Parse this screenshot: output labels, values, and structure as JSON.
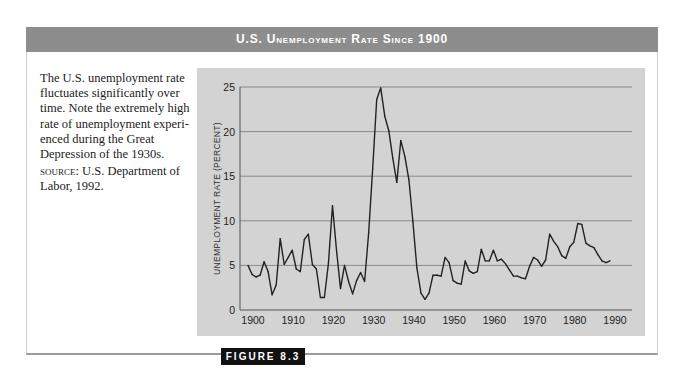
{
  "header": {
    "title": "U.S. Unemployment Rate Since 1900"
  },
  "caption": {
    "text": "The U.S. unemployment rate fluctuates significantly over time. Note the extremely high rate of unemployment experi­enced during the Great Depression of the 1930s.",
    "source_label": "source:",
    "source_text": " U.S. Department of Labor, 1992."
  },
  "figure_label": "FIGURE 8.3",
  "chart_data": {
    "type": "line",
    "title": "U.S. Unemployment Rate Since 1900",
    "xlabel": "",
    "ylabel": "UNEMPLOYMENT RATE (PERCENT)",
    "xlim": [
      1900,
      1990
    ],
    "ylim": [
      0,
      25
    ],
    "grid": true,
    "legend": "none",
    "x_ticks": [
      "1900",
      "1910",
      "1920",
      "1930",
      "1940",
      "1950",
      "1960",
      "1970",
      "1980",
      "1990"
    ],
    "y_ticks": [
      "0",
      "5",
      "10",
      "15",
      "20",
      "25"
    ],
    "series": [
      {
        "name": "Unemployment rate",
        "color": "#222222",
        "x": [
          1900,
          1901,
          1902,
          1903,
          1904,
          1905,
          1906,
          1907,
          1908,
          1909,
          1910,
          1911,
          1912,
          1913,
          1914,
          1915,
          1916,
          1917,
          1918,
          1919,
          1920,
          1921,
          1922,
          1923,
          1924,
          1925,
          1926,
          1927,
          1928,
          1929,
          1930,
          1931,
          1932,
          1933,
          1934,
          1935,
          1936,
          1937,
          1938,
          1939,
          1940,
          1941,
          1942,
          1943,
          1944,
          1945,
          1946,
          1947,
          1948,
          1949,
          1950,
          1951,
          1952,
          1953,
          1954,
          1955,
          1956,
          1957,
          1958,
          1959,
          1960,
          1961,
          1962,
          1963,
          1964,
          1965,
          1966,
          1967,
          1968,
          1969,
          1970,
          1971,
          1972,
          1973,
          1974,
          1975,
          1976,
          1977,
          1978,
          1979,
          1980,
          1981,
          1982,
          1983,
          1984,
          1985,
          1986,
          1987,
          1988,
          1989,
          1990
        ],
        "values": [
          5.0,
          4.0,
          3.7,
          3.9,
          5.4,
          4.3,
          1.7,
          2.8,
          8.0,
          5.1,
          5.9,
          6.7,
          4.6,
          4.3,
          7.9,
          8.5,
          5.1,
          4.6,
          1.4,
          1.4,
          5.2,
          11.7,
          6.7,
          2.4,
          5.0,
          3.2,
          1.8,
          3.3,
          4.2,
          3.2,
          8.7,
          15.9,
          23.6,
          24.9,
          21.7,
          20.1,
          17.0,
          14.3,
          19.0,
          17.2,
          14.6,
          9.9,
          4.7,
          1.9,
          1.2,
          1.9,
          3.9,
          3.9,
          3.8,
          5.9,
          5.3,
          3.3,
          3.0,
          2.9,
          5.5,
          4.4,
          4.1,
          4.3,
          6.8,
          5.5,
          5.5,
          6.7,
          5.5,
          5.7,
          5.2,
          4.5,
          3.8,
          3.8,
          3.6,
          3.5,
          4.9,
          5.9,
          5.6,
          4.9,
          5.6,
          8.5,
          7.7,
          7.1,
          6.1,
          5.8,
          7.1,
          7.6,
          9.7,
          9.6,
          7.5,
          7.2,
          7.0,
          6.2,
          5.5,
          5.3,
          5.5
        ]
      }
    ]
  }
}
